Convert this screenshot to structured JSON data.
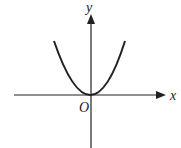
{
  "diagram": {
    "type": "coordinate-graph",
    "labels": {
      "x_axis": "x",
      "y_axis": "y",
      "origin": "O"
    },
    "curve": {
      "shape": "parabola",
      "vertex": "origin",
      "opens": "up"
    },
    "colors": {
      "stroke": "#222222",
      "background": "#ffffff"
    }
  }
}
